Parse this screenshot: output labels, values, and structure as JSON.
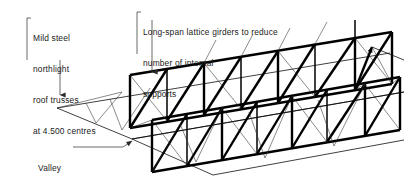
{
  "diagram": {
    "type": "isometric-structural-diagram",
    "ink_color": "#000000",
    "background_color": "#ffffff"
  },
  "annotations": {
    "trusses": {
      "name": "mild-steel-northlight-trusses",
      "lines": [
        "Mild steel",
        "northlight",
        "roof trusses",
        "at 4.500 centres"
      ],
      "text": "Mild steel northlight roof trusses at 4.500 centres",
      "leader": "vertical-line-with-down-arrow",
      "bracket": "left-corner-bracket"
    },
    "girders": {
      "name": "long-span-lattice-girders",
      "lines": [
        "Long-span lattice girders to reduce",
        "number of internal",
        "supports"
      ],
      "text": "Long-span lattice girders to reduce number of internal supports",
      "leader": "vertical-line-with-down-arrow",
      "bracket": "left-corner-bracket"
    },
    "valley": {
      "name": "valley-label",
      "lines": [
        "Valley"
      ],
      "text": "Valley",
      "leader": "horizontal-line-with-arrow"
    }
  },
  "components": {
    "lattice_girder_rear": "Long-span lattice girder (rear)",
    "lattice_girder_front": "Long-span lattice girder (front)",
    "roof_truss": "Northlight roof truss",
    "valley_line": "Valley between roof slopes",
    "roof_plane": "Sloping roof plane"
  }
}
